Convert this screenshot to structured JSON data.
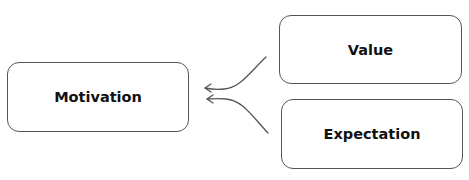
{
  "diagram": {
    "type": "flow",
    "nodes": [
      {
        "id": "motivation",
        "label": "Motivation"
      },
      {
        "id": "value",
        "label": "Value"
      },
      {
        "id": "expectation",
        "label": "Expectation"
      }
    ],
    "edges": [
      {
        "from": "value",
        "to": "motivation",
        "style": "curved-arrow"
      },
      {
        "from": "expectation",
        "to": "motivation",
        "style": "curved-arrow"
      }
    ],
    "colors": {
      "stroke": "#555555",
      "text": "#111111",
      "background": "#ffffff"
    }
  }
}
